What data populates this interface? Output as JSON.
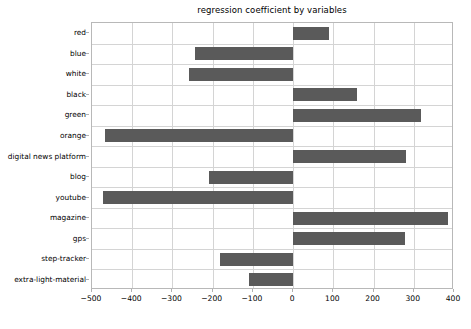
{
  "chart_data": {
    "type": "bar",
    "orientation": "horizontal",
    "title": "regression coefficient by variables",
    "xlabel": "",
    "ylabel": "",
    "categories": [
      "red",
      "blue",
      "white",
      "black",
      "green",
      "orange",
      "digital news platform",
      "blog",
      "youtube",
      "magazine",
      "gps",
      "step-tracker",
      "extra-light-material"
    ],
    "values": [
      90,
      -245,
      -258,
      159,
      318,
      -467,
      281,
      -208,
      -472,
      385,
      278,
      -183,
      -109
    ],
    "xlim": [
      -500,
      400
    ],
    "xticks": [
      -500,
      -400,
      -300,
      -200,
      -100,
      0,
      100,
      200,
      300,
      400
    ],
    "xtick_labels": [
      "−500",
      "−400",
      "−300",
      "−200",
      "−100",
      "0",
      "100",
      "200",
      "300",
      "400"
    ],
    "grid": true,
    "grid_axis": "both",
    "legend": false,
    "bar_color": "#5a5a5a",
    "grid_color": "#d4d4d4",
    "axes_color": "#b8b8b8",
    "background": "#ffffff"
  },
  "figure": {
    "caption_fragment": ""
  }
}
